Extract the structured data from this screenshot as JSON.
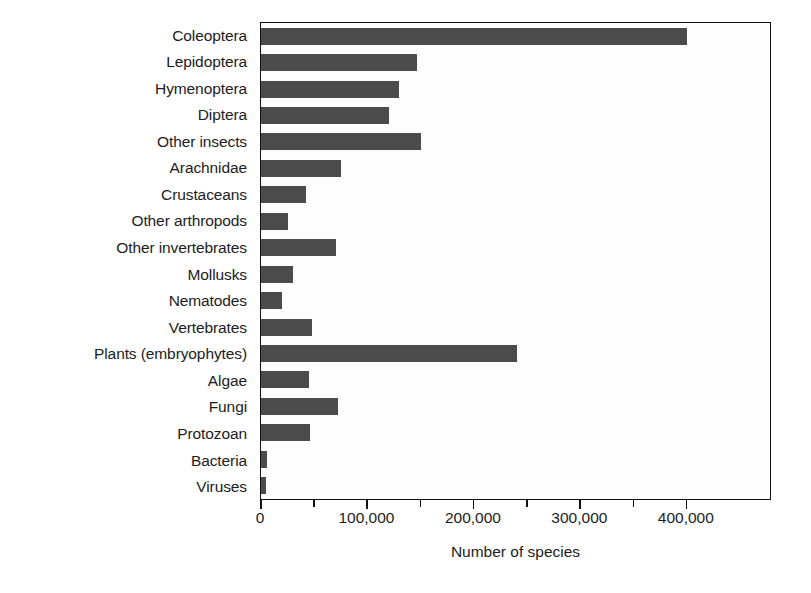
{
  "chart_data": {
    "type": "bar",
    "orientation": "horizontal",
    "title": "",
    "subtitle": "",
    "xlabel": "Number of species",
    "ylabel": "",
    "xlim": [
      0,
      480000
    ],
    "xticks": [
      0,
      50000,
      100000,
      150000,
      200000,
      250000,
      300000,
      350000,
      400000
    ],
    "xtick_labels": [
      "0",
      "",
      "100,000",
      "",
      "200,000",
      "",
      "300,000",
      "",
      "400,000"
    ],
    "grid": false,
    "legend": false,
    "legend_position": "none",
    "bar_color": "#4b4b4b",
    "axis_color": "#111111",
    "background_color": "#ffffff",
    "categories": [
      "Coleoptera",
      "Lepidoptera",
      "Hymenoptera",
      "Diptera",
      "Other insects",
      "Arachnidae",
      "Crustaceans",
      "Other arthropods",
      "Other invertebrates",
      "Mollusks",
      "Nematodes",
      "Vertebrates",
      "Plants (embryophytes)",
      "Algae",
      "Fungi",
      "Protozoan",
      "Bacteria",
      "Viruses"
    ],
    "values": [
      400000,
      147000,
      130000,
      120000,
      150000,
      75000,
      42000,
      25000,
      70000,
      30000,
      20000,
      48000,
      240000,
      45000,
      72000,
      46000,
      6000,
      5000
    ]
  }
}
